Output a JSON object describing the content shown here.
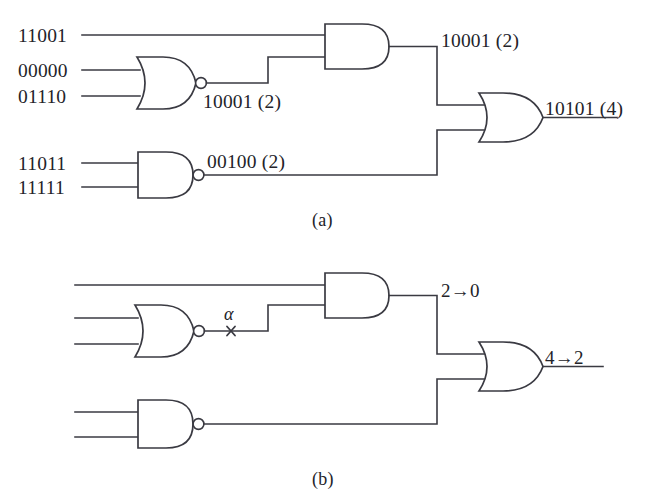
{
  "figure": {
    "ink_color": "#3a3a42",
    "text_color": "#232329",
    "background": "#ffffff"
  },
  "panel_a": {
    "caption": "(a)",
    "inputs": [
      {
        "name": "input-a1",
        "value": "11001"
      },
      {
        "name": "input-a2",
        "value": "00000"
      },
      {
        "name": "input-a3",
        "value": "01110"
      },
      {
        "name": "input-a4",
        "value": "11011"
      },
      {
        "name": "input-a5",
        "value": "11111"
      }
    ],
    "signals": [
      {
        "name": "nor-output",
        "value": "10001 (2)"
      },
      {
        "name": "and-output",
        "value": "10001 (2)"
      },
      {
        "name": "nand-output",
        "value": "00100 (2)"
      },
      {
        "name": "or-output",
        "value": "10101 (4)"
      }
    ],
    "gates": [
      {
        "name": "nor-gate",
        "type": "NOR"
      },
      {
        "name": "nand-gate",
        "type": "NAND"
      },
      {
        "name": "and-gate",
        "type": "AND"
      },
      {
        "name": "or-gate",
        "type": "OR"
      }
    ]
  },
  "panel_b": {
    "caption": "(b)",
    "fault_label": "α",
    "signals": [
      {
        "name": "and-output-fault",
        "value": "2→0"
      },
      {
        "name": "or-output-fault",
        "value": "4→2"
      }
    ],
    "gates": [
      {
        "name": "nor-gate",
        "type": "NOR"
      },
      {
        "name": "nand-gate",
        "type": "NAND"
      },
      {
        "name": "and-gate",
        "type": "AND"
      },
      {
        "name": "or-gate",
        "type": "OR"
      }
    ]
  }
}
